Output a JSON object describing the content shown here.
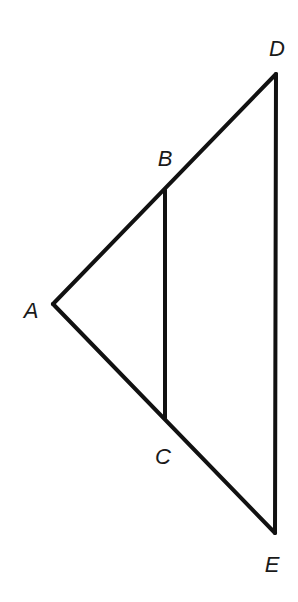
{
  "diagram": {
    "type": "geometry-figure",
    "points": [
      {
        "id": "A",
        "label": "A",
        "x": 53,
        "y": 304,
        "label_x": 31,
        "label_y": 318
      },
      {
        "id": "B",
        "label": "B",
        "x": 165,
        "y": 190,
        "label_x": 165,
        "label_y": 166
      },
      {
        "id": "C",
        "label": "C",
        "x": 165,
        "y": 418,
        "label_x": 163,
        "label_y": 464
      },
      {
        "id": "D",
        "label": "D",
        "x": 276,
        "y": 74,
        "label_x": 277,
        "label_y": 56
      },
      {
        "id": "E",
        "label": "E",
        "x": 275,
        "y": 533,
        "label_x": 272,
        "label_y": 572
      }
    ],
    "segments": [
      {
        "from": "A",
        "to": "D"
      },
      {
        "from": "A",
        "to": "E"
      },
      {
        "from": "D",
        "to": "E"
      },
      {
        "from": "B",
        "to": "C"
      }
    ],
    "stroke_color": "#111111",
    "label_color": "#1a1a1a"
  }
}
